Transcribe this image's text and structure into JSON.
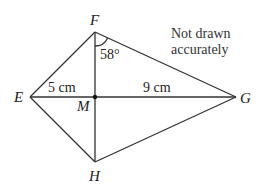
{
  "diagram": {
    "type": "kite",
    "note": [
      "Not drawn",
      "accurately"
    ],
    "points": {
      "E": {
        "label": "E",
        "x": 30,
        "y": 97
      },
      "F": {
        "label": "F",
        "x": 95,
        "y": 32
      },
      "G": {
        "label": "G",
        "x": 236,
        "y": 97
      },
      "H": {
        "label": "H",
        "x": 95,
        "y": 162
      },
      "M": {
        "label": "M",
        "x": 95,
        "y": 97
      }
    },
    "measurements": {
      "EM": "5 cm",
      "MG": "9 cm",
      "angle_MFG": "58°"
    },
    "colors": {
      "line": "#333333",
      "text": "#222222"
    }
  }
}
